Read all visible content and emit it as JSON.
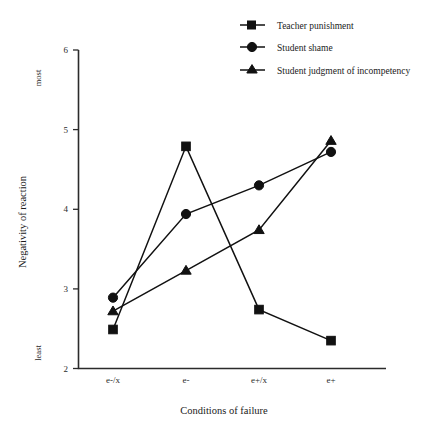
{
  "chart_data": {
    "type": "line",
    "title": "",
    "xlabel": "Conditions of failure",
    "ylabel": "Negativity of reaction",
    "categories": [
      "e-/x",
      "e-",
      "e+/x",
      "e+"
    ],
    "ylim": [
      2,
      6
    ],
    "yticks": [
      2,
      3,
      4,
      5,
      6
    ],
    "ytick_labels": [
      "2",
      "3",
      "4",
      "5",
      "6"
    ],
    "y_axis_low_label": "least",
    "y_axis_high_label": "most",
    "grid": false,
    "legend_position": "top-right",
    "series": [
      {
        "name": "Teacher punishment",
        "marker": "square",
        "values": [
          2.49,
          4.79,
          2.74,
          2.35
        ]
      },
      {
        "name": "Student shame",
        "marker": "circle",
        "values": [
          2.89,
          3.94,
          4.3,
          4.72
        ]
      },
      {
        "name": "Student judgment of incompetency",
        "marker": "triangle",
        "values": [
          2.72,
          3.23,
          3.74,
          4.86
        ]
      }
    ]
  },
  "legend": {
    "items": [
      {
        "label": "Teacher punishment"
      },
      {
        "label": "Student shame"
      },
      {
        "label": "Student judgment of incompetency"
      }
    ]
  },
  "axes": {
    "y_title": "Negativity of reaction",
    "x_title": "Conditions of failure",
    "y_low": "least",
    "y_high": "most",
    "y_tick_2": "2",
    "y_tick_3": "3",
    "y_tick_4": "4",
    "y_tick_5": "5",
    "y_tick_6": "6",
    "x_tick_1": "e-/x",
    "x_tick_2": "e-",
    "x_tick_3": "e+/x",
    "x_tick_4": "e+"
  }
}
